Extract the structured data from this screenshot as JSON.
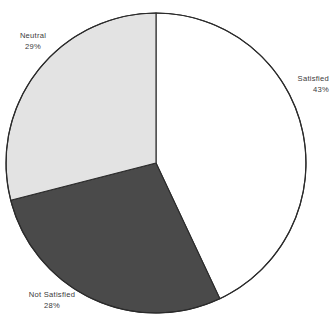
{
  "chart_data": {
    "type": "pie",
    "title": "",
    "subtitle": "",
    "xlabel": "",
    "ylabel": "",
    "legend_position": "none",
    "grid": false,
    "categories": [
      "Satisfied",
      "Not Satisfied",
      "Neutral"
    ],
    "values": [
      43,
      28,
      29
    ],
    "value_unit": "%",
    "total": 100,
    "start_angle_deg": 0,
    "direction": "clockwise",
    "slices": [
      {
        "label": "Satisfied",
        "value": 43,
        "value_label": "43%",
        "color": "#ffffff",
        "stroke": "#2b2b2b",
        "start_angle_deg": 0,
        "end_angle_deg": 154.8
      },
      {
        "label": "Not Satisfied",
        "value": 28,
        "value_label": "28%",
        "color": "#4a4a4a",
        "stroke": "#2b2b2b",
        "start_angle_deg": 154.8,
        "end_angle_deg": 255.6
      },
      {
        "label": "Neutral",
        "value": 29,
        "value_label": "29%",
        "color": "#e3e3e3",
        "stroke": "#2b2b2b",
        "start_angle_deg": 255.6,
        "end_angle_deg": 360
      }
    ],
    "geometry": {
      "center_x": 156,
      "center_y": 163,
      "radius": 150
    },
    "colors": {
      "background": "#ffffff",
      "satisfied": "#ffffff",
      "not_satisfied": "#4a4a4a",
      "neutral": "#e3e3e3",
      "outline": "#2b2b2b",
      "label_text": "#3a3a3a"
    }
  },
  "labels": {
    "satisfied": {
      "name": "Satisfied",
      "percent": "43%"
    },
    "not_satisfied": {
      "name": "Not Satisfied",
      "percent": "28%"
    },
    "neutral": {
      "name": "Neutral",
      "percent": "29%"
    }
  }
}
